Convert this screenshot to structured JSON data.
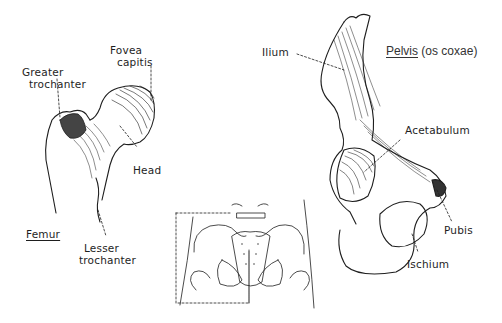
{
  "figure": {
    "femur": {
      "title": "Femur",
      "labels": {
        "greater_trochanter_1": "Greater",
        "greater_trochanter_2": "trochanter",
        "fovea_capitis_1": "Fovea",
        "fovea_capitis_2": "capitis",
        "head": "Head",
        "lesser_trochanter_1": "Lesser",
        "lesser_trochanter_2": "trochanter"
      }
    },
    "pelvis": {
      "title_underlined": "Pelvis",
      "title_rest": " (os coxae)",
      "labels": {
        "ilium": "Ilium",
        "acetabulum": "Acetabulum",
        "pubis": "Pubis",
        "ischium": "Ischium"
      }
    },
    "colors": {
      "ink": "#1e1e1e",
      "background": "#ffffff"
    }
  }
}
